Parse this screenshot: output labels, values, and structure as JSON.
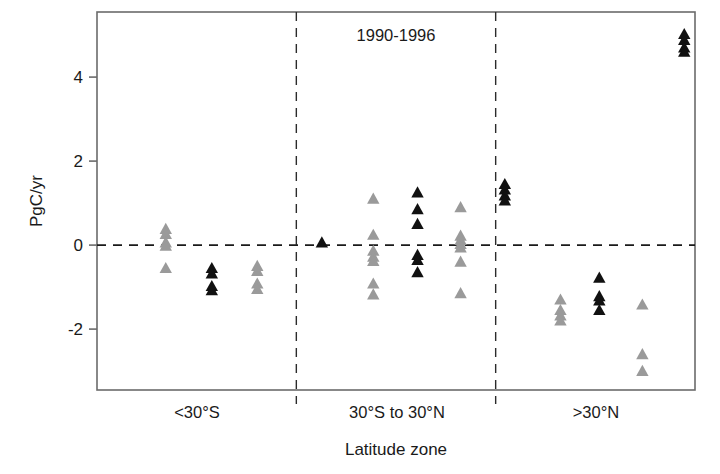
{
  "figure": {
    "title": "1990-1996",
    "width": 720,
    "height": 474,
    "background": "#ffffff"
  },
  "axes": {
    "ylabel": "PgC/yr",
    "xlabel": "Latitude zone",
    "yticks": [
      "-2",
      "0",
      "2",
      "4"
    ],
    "ytick_values": [
      -2,
      0,
      2,
      4
    ],
    "ylim": [
      -3.45,
      5.55
    ],
    "zero_reference_line": 0,
    "frame_color": "#6b6b6b"
  },
  "zones": [
    {
      "label": "<30°S"
    },
    {
      "label": "30°S to 30°N"
    },
    {
      "label": ">30°N"
    }
  ],
  "colors": {
    "dark_marker": "#111111",
    "light_marker": "#9a9a9a",
    "axis": "#6b6b6b",
    "text": "#1a1a1a"
  },
  "chart_data": {
    "type": "scatter",
    "title": "1990-1996",
    "xlabel": "Latitude zone",
    "ylabel": "PgC/yr",
    "ylim": [
      -3.45,
      5.55
    ],
    "yticks": [
      -2,
      0,
      2,
      4
    ],
    "grid": false,
    "legend": "none",
    "zero_line": 0,
    "zone_boundaries": [
      "<30°S",
      "30°S to 30°N",
      ">30°N"
    ],
    "marker": "triangle-up",
    "series": [
      {
        "name": "zone1-group-a",
        "zone": "<30°S",
        "color": "#9a9a9a",
        "x": 0.115,
        "values": [
          0.38,
          0.26,
          0.06,
          -0.02,
          -0.55
        ]
      },
      {
        "name": "zone1-group-b",
        "zone": "<30°S",
        "color": "#111111",
        "x": 0.192,
        "values": [
          -0.55,
          -0.68,
          -0.98,
          -1.08
        ]
      },
      {
        "name": "zone1-group-c",
        "zone": "<30°S",
        "color": "#9a9a9a",
        "x": 0.268,
        "values": [
          -0.5,
          -0.62,
          -0.92,
          -1.05
        ]
      },
      {
        "name": "zone1-group-d",
        "zone": "<30°S",
        "color": "#111111",
        "x": 0.376,
        "values": [
          0.06
        ]
      },
      {
        "name": "zone2-group-a",
        "zone": "30°S to 30°N",
        "color": "#9a9a9a",
        "x": 0.462,
        "values": [
          1.1,
          0.24,
          -0.14,
          -0.28,
          -0.38,
          -0.92,
          -1.18
        ]
      },
      {
        "name": "zone2-group-b",
        "zone": "30°S to 30°N",
        "color": "#111111",
        "x": 0.536,
        "values": [
          1.25,
          0.85,
          0.5,
          -0.24,
          -0.36,
          -0.65
        ]
      },
      {
        "name": "zone2-group-c",
        "zone": "30°S to 30°N",
        "color": "#9a9a9a",
        "x": 0.608,
        "values": [
          0.9,
          0.22,
          0.12,
          0.02,
          -0.06,
          -0.4,
          -1.15
        ]
      },
      {
        "name": "zone2-group-d",
        "zone": "30°S to 30°N",
        "color": "#111111",
        "x": 0.682,
        "values": [
          1.45,
          1.32,
          1.18,
          1.06
        ]
      },
      {
        "name": "zone3-group-a",
        "zone": ">30°N",
        "color": "#9a9a9a",
        "x": 0.775,
        "values": [
          -1.3,
          -1.55,
          -1.68,
          -1.8
        ]
      },
      {
        "name": "zone3-group-b",
        "zone": ">30°N",
        "color": "#111111",
        "x": 0.84,
        "values": [
          -0.78,
          -1.22,
          -1.32,
          -1.55
        ]
      },
      {
        "name": "zone3-group-c",
        "zone": ">30°N",
        "color": "#9a9a9a",
        "x": 0.912,
        "values": [
          -1.42,
          -2.6,
          -3.0
        ]
      },
      {
        "name": "zone3-group-d",
        "zone": ">30°N",
        "color": "#111111",
        "x": 0.982,
        "values": [
          5.02,
          4.88,
          4.7,
          4.6
        ]
      }
    ]
  }
}
